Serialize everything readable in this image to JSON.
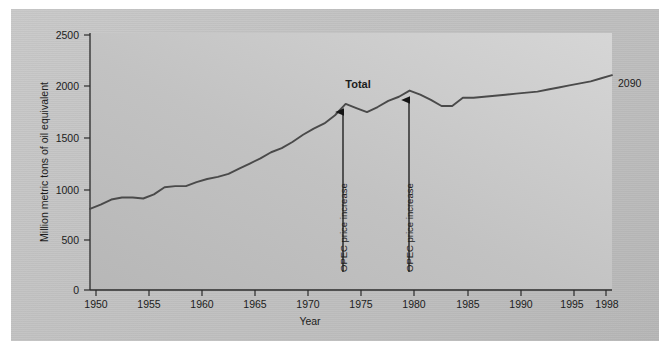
{
  "figure": {
    "background_color": "#c3c3c3",
    "plot_background_color": "#c6c6c6",
    "line_color": "#4a4a4a",
    "text_color": "#1c1c1c"
  },
  "chart_data": {
    "type": "line",
    "title": "",
    "xlabel": "Year",
    "ylabel": "Million metric tons of oil equivalent",
    "xlim": [
      1949,
      1998
    ],
    "ylim": [
      0,
      2500
    ],
    "xticks": [
      1950,
      1955,
      1960,
      1965,
      1970,
      1975,
      1980,
      1985,
      1990,
      1995,
      1998
    ],
    "xtick_labels": [
      "1950",
      "1955",
      "1960",
      "1965",
      "1970",
      "1975",
      "1980",
      "1985",
      "1990",
      "1995",
      "1998"
    ],
    "yticks": [
      0,
      500,
      1000,
      1500,
      2000,
      2500
    ],
    "ytick_labels": [
      "0",
      "500",
      "1000",
      "1500",
      "2000",
      "2500"
    ],
    "grid": false,
    "legend_position": "inline-label",
    "series": [
      {
        "name": "Total",
        "label": "Total",
        "color": "#4a4a4a",
        "x": [
          1949,
          1950,
          1951,
          1952,
          1953,
          1954,
          1955,
          1956,
          1957,
          1958,
          1959,
          1960,
          1961,
          1962,
          1963,
          1964,
          1965,
          1966,
          1967,
          1968,
          1969,
          1970,
          1971,
          1972,
          1973,
          1974,
          1975,
          1976,
          1977,
          1978,
          1979,
          1980,
          1981,
          1982,
          1983,
          1984,
          1985,
          1986,
          1987,
          1988,
          1989,
          1990,
          1991,
          1992,
          1993,
          1994,
          1995,
          1996,
          1997,
          1998
        ],
        "y": [
          790,
          830,
          880,
          900,
          900,
          890,
          930,
          1000,
          1010,
          1010,
          1050,
          1080,
          1100,
          1130,
          1180,
          1230,
          1280,
          1340,
          1380,
          1440,
          1510,
          1570,
          1620,
          1700,
          1810,
          1770,
          1730,
          1780,
          1840,
          1880,
          1940,
          1900,
          1850,
          1790,
          1790,
          1870,
          1870,
          1880,
          1890,
          1900,
          1910,
          1920,
          1930,
          1950,
          1970,
          1990,
          2010,
          2030,
          2060,
          2090
        ]
      }
    ],
    "annotations": [
      {
        "id": "opec-1",
        "text": "OPEC price increase",
        "year": 1973,
        "value": 1810,
        "orientation": "vertical",
        "arrow": "up"
      },
      {
        "id": "opec-2",
        "text": "OPEC price increase",
        "year": 1979,
        "value": 1940,
        "orientation": "vertical",
        "arrow": "up"
      },
      {
        "id": "end-value",
        "text": "2090",
        "year": 1998,
        "value": 2090,
        "orientation": "horizontal",
        "arrow": "none"
      },
      {
        "id": "series-name",
        "text": "Total",
        "year": 1973,
        "value": 2020,
        "orientation": "horizontal",
        "arrow": "none"
      }
    ]
  }
}
